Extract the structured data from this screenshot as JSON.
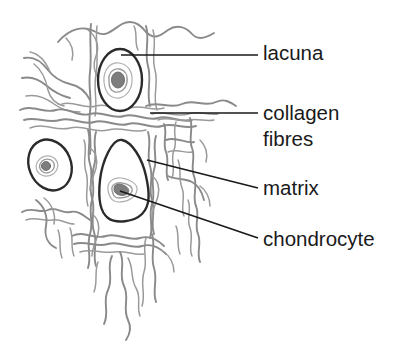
{
  "figure": {
    "background_color": "#ffffff",
    "width": 394,
    "height": 342
  },
  "colors": {
    "label_text": "#1a1a1a",
    "leader_line": "#1a1a1a",
    "collagen_fibre": "#8a8a8a",
    "lacuna_outline": "#2b2b2b",
    "cytoplasm_ring": "#9c9c9c",
    "nucleus": "#7d7d7d",
    "cell_fill": "#ffffff"
  },
  "labels": [
    {
      "id": "lacuna",
      "text": "lacuna",
      "text_x": 263,
      "text_y": 60,
      "leader": {
        "x1": 121,
        "y1": 55,
        "x2": 258,
        "y2": 55
      },
      "points_to": "top-lacuna-outline"
    },
    {
      "id": "collagen-fibres",
      "text": "collagen",
      "text_line2": "fibres",
      "text_x": 263,
      "text_y": 120,
      "text_y2": 146,
      "leader": {
        "x1": 150,
        "y1": 113,
        "x2": 258,
        "y2": 113
      },
      "points_to": "collagen-fibre-network"
    },
    {
      "id": "matrix",
      "text": "matrix",
      "text_x": 263,
      "text_y": 195,
      "leader": {
        "x1": 147,
        "y1": 160,
        "x2": 258,
        "y2": 188
      },
      "points_to": "extracellular-matrix"
    },
    {
      "id": "chondrocyte",
      "text": "chondrocyte",
      "text_x": 263,
      "text_y": 246,
      "leader": {
        "x1": 120,
        "y1": 191,
        "x2": 258,
        "y2": 238
      },
      "points_to": "bottom-chondrocyte-nucleus"
    }
  ],
  "cells": [
    {
      "id": "top-lacuna",
      "name": "top lacuna with chondrocyte",
      "shape": "oval",
      "center_x": 120,
      "center_y": 80,
      "radius_x": 22,
      "radius_y": 31,
      "nucleus_x": 118,
      "nucleus_y": 80,
      "nucleus_rx": 7,
      "nucleus_ry": 8,
      "ring_count": 2
    },
    {
      "id": "left-lacuna",
      "name": "left lacuna with chondrocyte",
      "shape": "tilted-oval",
      "center_x": 50,
      "center_y": 165,
      "radius_x": 21,
      "radius_y": 26,
      "rotation": -22,
      "nucleus_x": 46,
      "nucleus_y": 166,
      "nucleus_rx": 5,
      "nucleus_ry": 5,
      "ring_count": 2
    },
    {
      "id": "bottom-lacuna",
      "name": "large lacuna with chondrocyte",
      "shape": "teardrop",
      "center_x": 123,
      "center_y": 180,
      "nucleus_x": 120,
      "nucleus_y": 190,
      "nucleus_rx": 7,
      "nucleus_ry": 6,
      "ring_count": 2
    }
  ],
  "structures": [
    {
      "id": "collagen-fibre-network",
      "name": "collagen fibres",
      "description": "wavy interwoven grey fibre bundles forming the meshwork of the cartilage matrix"
    },
    {
      "id": "extracellular-matrix",
      "name": "matrix",
      "description": "ground substance between cells and fibres"
    }
  ]
}
